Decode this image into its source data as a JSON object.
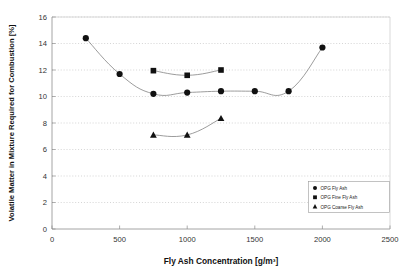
{
  "chart_data": {
    "type": "line",
    "title": "",
    "xlabel": "Fly Ash Concentration [g/m³]",
    "ylabel": "Volatile Matter in Mixture Required for Combustion [%]",
    "xlim": [
      0,
      2500
    ],
    "ylim": [
      0,
      16
    ],
    "xticks": [
      0,
      500,
      1000,
      1500,
      2000,
      2500
    ],
    "yticks": [
      0,
      2,
      4,
      6,
      8,
      10,
      12,
      14,
      16
    ],
    "xtick_labels": [
      "0",
      "500",
      "1000",
      "1500",
      "2000",
      "2500"
    ],
    "ytick_labels": [
      "0",
      "2",
      "4",
      "6",
      "8",
      "10",
      "12",
      "14",
      "16"
    ],
    "grid": "horizontal-dotted",
    "legend_position": "lower-right-inside",
    "series": [
      {
        "name": "OPG Fly Ash",
        "marker": "circle",
        "x": [
          250,
          500,
          750,
          1000,
          1250,
          1500,
          1750,
          2000
        ],
        "values": [
          14.4,
          11.7,
          10.2,
          10.3,
          10.4,
          10.4,
          10.4,
          13.7
        ]
      },
      {
        "name": "OPG Fine Fly Ash",
        "marker": "square",
        "x": [
          750,
          1000,
          1250
        ],
        "values": [
          11.95,
          11.6,
          12.0
        ]
      },
      {
        "name": "OPG Coarse Fly Ash",
        "marker": "triangle",
        "x": [
          750,
          1000,
          1250
        ],
        "values": [
          7.1,
          7.1,
          8.35
        ]
      }
    ]
  },
  "legend": {
    "entries": [
      {
        "label": "OPG Fly Ash",
        "marker": "circle"
      },
      {
        "label": "OPG Fine Fly Ash",
        "marker": "square"
      },
      {
        "label": "OPG Coarse Fly Ash",
        "marker": "triangle"
      }
    ]
  },
  "colors": {
    "marker": "#111111",
    "line": "#8a8a8a",
    "grid": "#b9b9b9",
    "axis": "#8d8d8d",
    "background": "#ffffff"
  }
}
